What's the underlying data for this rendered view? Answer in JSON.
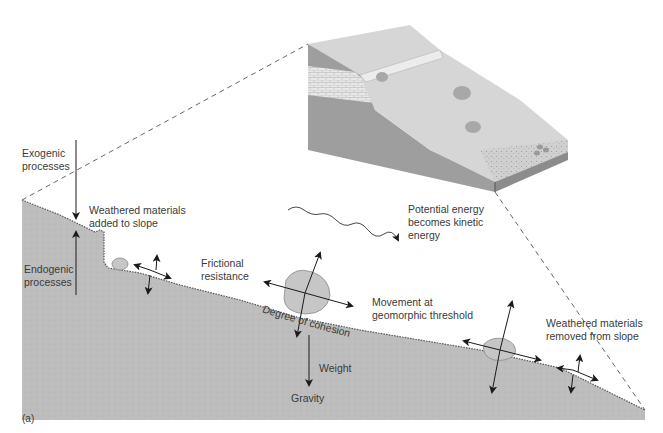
{
  "figure": {
    "panel_label": "(a)",
    "colors": {
      "ground": "#bdbdbd",
      "ground_dark": "#a9a9a9",
      "block_top": "#d8d8d8",
      "block_side": "#9e9e9e",
      "block_front": "#b5b5b5",
      "rock": "#c6c6c6",
      "arrow": "#1a1a1a",
      "text": "#3a3a3a"
    },
    "labels": {
      "exogenic": [
        "Exogenic",
        "processes"
      ],
      "endogenic": [
        "Endogenic",
        "processes"
      ],
      "weathered_added": [
        "Weathered materials",
        "added to slope"
      ],
      "frictional": [
        "Frictional",
        "resistance"
      ],
      "potential_energy": [
        "Potential energy",
        "becomes kinetic",
        "energy"
      ],
      "movement": [
        "Movement at",
        "geomorphic threshold"
      ],
      "weathered_removed": [
        "Weathered materials",
        "removed from slope"
      ],
      "degree_of_cohesion": "Degree of cohesion",
      "weight": "Weight",
      "gravity": "Gravity"
    }
  }
}
